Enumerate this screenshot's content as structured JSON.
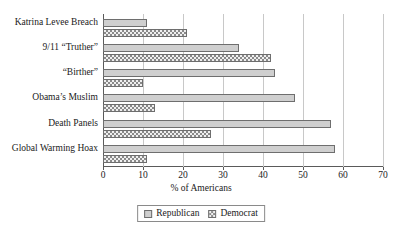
{
  "chart_data": {
    "type": "bar",
    "orientation": "horizontal",
    "title": "",
    "xlabel": "% of Americans",
    "ylabel": "",
    "xlim": [
      0,
      70
    ],
    "xticks": [
      0,
      10,
      20,
      30,
      40,
      50,
      60,
      70
    ],
    "grid": true,
    "legend_position": "bottom-center",
    "categories": [
      "Katrina Levee Breach",
      "9/11 “Truther”",
      "“Birther”",
      "Obama’s Muslim",
      "Death Panels",
      "Global Warming Hoax"
    ],
    "series": [
      {
        "name": "Republican",
        "values": [
          11,
          34,
          43,
          48,
          57,
          58
        ],
        "style": "solid-gray",
        "color": "#cfcfcf"
      },
      {
        "name": "Democrat",
        "values": [
          21,
          42,
          10,
          13,
          27,
          11
        ],
        "style": "crosshatch",
        "color": "#8a8a8a"
      }
    ]
  },
  "legend": {
    "items": [
      {
        "label": "Republican"
      },
      {
        "label": "Democrat"
      }
    ]
  },
  "axis": {
    "x_title": "% of Americans"
  }
}
